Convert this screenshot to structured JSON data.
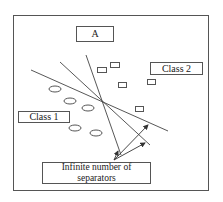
{
  "diagram": {
    "title_label": "A",
    "class1_label": "Class 1",
    "class2_label": "Class 2",
    "separators_label_line1": "Infinite number of",
    "separators_label_line2": "separators"
  },
  "colors": {
    "stroke": "#444444",
    "background": "#ffffff"
  },
  "class1_points": [
    {
      "cx": 55,
      "cy": 89
    },
    {
      "cx": 70,
      "cy": 101
    },
    {
      "cx": 88,
      "cy": 108
    },
    {
      "cx": 75,
      "cy": 128
    },
    {
      "cx": 96,
      "cy": 133
    }
  ],
  "class2_points": [
    {
      "x": 97,
      "y": 67
    },
    {
      "x": 110,
      "y": 62
    },
    {
      "x": 118,
      "y": 82
    },
    {
      "x": 147,
      "y": 79
    },
    {
      "x": 135,
      "y": 106
    }
  ],
  "separator_lines": [
    {
      "x1": 86,
      "y1": 55,
      "x2": 121,
      "y2": 155
    },
    {
      "x1": 60,
      "y1": 62,
      "x2": 150,
      "y2": 145
    },
    {
      "x1": 31,
      "y1": 70,
      "x2": 168,
      "y2": 131
    }
  ]
}
